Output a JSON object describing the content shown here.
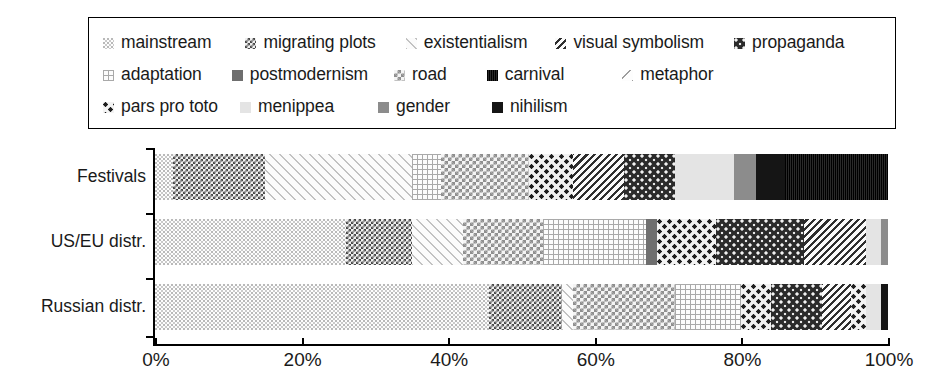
{
  "legend": {
    "rows": [
      [
        {
          "label": "mainstream",
          "pattern": "p-mainstream"
        },
        {
          "label": "migrating plots",
          "pattern": "p-migrating"
        },
        {
          "label": "existentialism",
          "pattern": "p-existentialism"
        },
        {
          "label": "visual symbolism",
          "pattern": "p-visual"
        },
        {
          "label": "propaganda",
          "pattern": "p-propaganda"
        }
      ],
      [
        {
          "label": "adaptation",
          "pattern": "p-adaptation"
        },
        {
          "label": "postmodernism",
          "pattern": "p-postmodernism"
        },
        {
          "label": "road",
          "pattern": "p-road"
        },
        {
          "label": "carnival",
          "pattern": "p-carnival"
        },
        {
          "label": "metaphor",
          "pattern": "p-metaphor"
        }
      ],
      [
        {
          "label": "pars pro toto",
          "pattern": "p-pars"
        },
        {
          "label": "menippea",
          "pattern": "p-menippea"
        },
        {
          "label": "gender",
          "pattern": "p-gender"
        },
        {
          "label": "nihilism",
          "pattern": "p-nihilism"
        }
      ]
    ]
  },
  "chart_data": {
    "type": "bar",
    "orientation": "horizontal",
    "stacked": true,
    "normalized_percent": true,
    "title": "",
    "xlabel": "",
    "ylabel": "",
    "xlim": [
      0,
      100
    ],
    "xticks": [
      "0%",
      "20%",
      "40%",
      "60%",
      "80%",
      "100%"
    ],
    "xtick_values": [
      0,
      20,
      40,
      60,
      80,
      100
    ],
    "grid": false,
    "legend_position": "top",
    "categories": [
      "Festivals",
      "US/EU distr.",
      "Russian distr."
    ],
    "series": [
      {
        "name": "mainstream",
        "pattern": "p-mainstream",
        "values": [
          2.5,
          26.0,
          45.5
        ]
      },
      {
        "name": "migrating plots",
        "pattern": "p-migrating",
        "values": [
          12.5,
          9.0,
          10.0
        ]
      },
      {
        "name": "existentialism",
        "pattern": "p-existentialism",
        "values": [
          20.0,
          7.0,
          1.5
        ]
      },
      {
        "name": "adaptation",
        "pattern": "p-adaptation",
        "values": [
          4.0,
          14.0,
          9.0
        ]
      },
      {
        "name": "road",
        "pattern": "p-road",
        "values": [
          12.0,
          11.0,
          14.0
        ]
      },
      {
        "name": "postmodernism",
        "pattern": "p-postmodernism",
        "values": [
          0.0,
          1.5,
          1.5
        ]
      },
      {
        "name": "pars pro toto",
        "pattern": "p-pars",
        "values": [
          6.0,
          8.0,
          4.0
        ]
      },
      {
        "name": "visual symbolism",
        "pattern": "p-visual",
        "values": [
          7.0,
          4.5,
          3.0
        ]
      },
      {
        "name": "propaganda",
        "pattern": "p-propaganda",
        "values": [
          7.0,
          12.0,
          7.0
        ]
      },
      {
        "name": "menippea",
        "pattern": "p-menippea",
        "values": [
          8.0,
          1.5,
          1.0
        ]
      },
      {
        "name": "gender",
        "pattern": "p-gender",
        "values": [
          3.0,
          0.5,
          0.5
        ]
      },
      {
        "name": "carnival",
        "pattern": "p-carnival",
        "values": [
          0.0,
          1.0,
          0.0
        ]
      },
      {
        "name": "nihilism",
        "pattern": "p-nihilism",
        "values": [
          4.0,
          0.0,
          0.5
        ]
      },
      {
        "name": "metaphor",
        "pattern": "p-metaphor",
        "values": [
          0.0,
          0.0,
          0.0
        ]
      }
    ],
    "bars": [
      {
        "category": "Festivals",
        "segments": [
          {
            "name": "mainstream",
            "pattern": "p-mainstream",
            "value": 2.5
          },
          {
            "name": "migrating plots",
            "pattern": "p-migrating",
            "value": 12.5
          },
          {
            "name": "existentialism",
            "pattern": "p-existentialism",
            "value": 20.0
          },
          {
            "name": "adaptation",
            "pattern": "p-adaptation",
            "value": 4.0
          },
          {
            "name": "road",
            "pattern": "p-road",
            "value": 12.0
          },
          {
            "name": "pars pro toto",
            "pattern": "p-pars",
            "value": 6.0
          },
          {
            "name": "visual symbolism",
            "pattern": "p-visual",
            "value": 7.0
          },
          {
            "name": "propaganda",
            "pattern": "p-propaganda",
            "value": 7.0
          },
          {
            "name": "menippea",
            "pattern": "p-menippea",
            "value": 8.0
          },
          {
            "name": "gender",
            "pattern": "p-gender",
            "value": 3.0
          },
          {
            "name": "nihilism",
            "pattern": "p-nihilism",
            "value": 4.0
          },
          {
            "name": "carnival",
            "pattern": "p-carnival",
            "value": 14.0
          }
        ]
      },
      {
        "category": "US/EU distr.",
        "segments": [
          {
            "name": "mainstream",
            "pattern": "p-mainstream",
            "value": 26.0
          },
          {
            "name": "migrating plots",
            "pattern": "p-migrating",
            "value": 9.0
          },
          {
            "name": "existentialism",
            "pattern": "p-existentialism",
            "value": 7.0
          },
          {
            "name": "road",
            "pattern": "p-road",
            "value": 11.0
          },
          {
            "name": "adaptation",
            "pattern": "p-adaptation",
            "value": 14.0
          },
          {
            "name": "postmodernism",
            "pattern": "p-postmodernism",
            "value": 1.5
          },
          {
            "name": "pars pro toto",
            "pattern": "p-pars",
            "value": 8.0
          },
          {
            "name": "propaganda",
            "pattern": "p-propaganda",
            "value": 12.0
          },
          {
            "name": "visual symbolism",
            "pattern": "p-visual",
            "value": 8.5
          },
          {
            "name": "menippea",
            "pattern": "p-menippea",
            "value": 2.0
          },
          {
            "name": "gender",
            "pattern": "p-gender",
            "value": 1.0
          }
        ]
      },
      {
        "category": "Russian distr.",
        "segments": [
          {
            "name": "mainstream",
            "pattern": "p-mainstream",
            "value": 45.5
          },
          {
            "name": "migrating plots",
            "pattern": "p-migrating",
            "value": 10.0
          },
          {
            "name": "existentialism",
            "pattern": "p-existentialism",
            "value": 1.5
          },
          {
            "name": "road",
            "pattern": "p-road",
            "value": 14.0
          },
          {
            "name": "adaptation",
            "pattern": "p-adaptation",
            "value": 9.0
          },
          {
            "name": "pars pro toto",
            "pattern": "p-pars",
            "value": 4.0
          },
          {
            "name": "propaganda",
            "pattern": "p-propaganda",
            "value": 7.0
          },
          {
            "name": "visual symbolism",
            "pattern": "p-visual",
            "value": 4.0
          },
          {
            "name": "carnival",
            "pattern": "p-pars",
            "value": 2.0
          },
          {
            "name": "menippea",
            "pattern": "p-menippea",
            "value": 2.0
          },
          {
            "name": "nihilism",
            "pattern": "p-nihilism",
            "value": 1.0
          }
        ]
      }
    ]
  }
}
